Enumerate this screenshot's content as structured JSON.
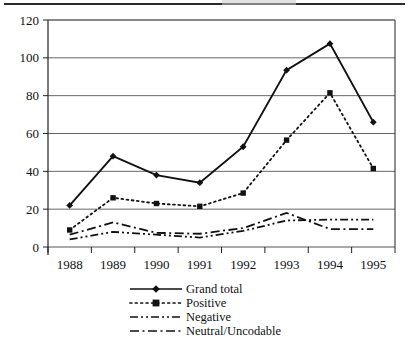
{
  "figure": {
    "has_top_rule": true,
    "background": "#ffffff",
    "line_color": "#111111"
  },
  "chart_data": {
    "type": "line",
    "title": "",
    "subtitle": "",
    "xlabel": "",
    "ylabel": "",
    "categories": [
      "1988",
      "1989",
      "1990",
      "1991",
      "1992",
      "1993",
      "1994",
      "1995"
    ],
    "x": [
      1988,
      1989,
      1990,
      1991,
      1992,
      1993,
      1994,
      1995
    ],
    "ylim": [
      0,
      120
    ],
    "ytick_labels": [
      "0",
      "20",
      "40",
      "60",
      "80",
      "100",
      "120"
    ],
    "yticks": [
      0,
      20,
      40,
      60,
      80,
      100,
      120
    ],
    "grid": "horizontal",
    "legend_position": "bottom-center",
    "series": [
      {
        "name": "Grand total",
        "style": "solid",
        "marker": "diamond",
        "values": [
          22,
          48,
          38,
          34,
          53,
          93.5,
          107.5,
          66
        ]
      },
      {
        "name": "Positive",
        "style": "dotted",
        "marker": "square",
        "values": [
          9,
          26,
          23,
          21.5,
          28.5,
          56.5,
          81.5,
          41.5
        ]
      },
      {
        "name": "Negative",
        "style": "dash-dot",
        "marker": "none",
        "values": [
          4,
          8,
          6.5,
          5,
          8.5,
          14,
          14.5,
          14.5
        ]
      },
      {
        "name": "Neutral/Uncodable",
        "style": "dash-dot-dot",
        "marker": "none",
        "values": [
          6.5,
          13,
          7.5,
          7,
          10,
          18,
          9.5,
          9.5
        ]
      }
    ]
  },
  "legend": {
    "entries": [
      {
        "label": "Grand total"
      },
      {
        "label": "Positive"
      },
      {
        "label": "Negative"
      },
      {
        "label": "Neutral/Uncodable"
      }
    ]
  }
}
